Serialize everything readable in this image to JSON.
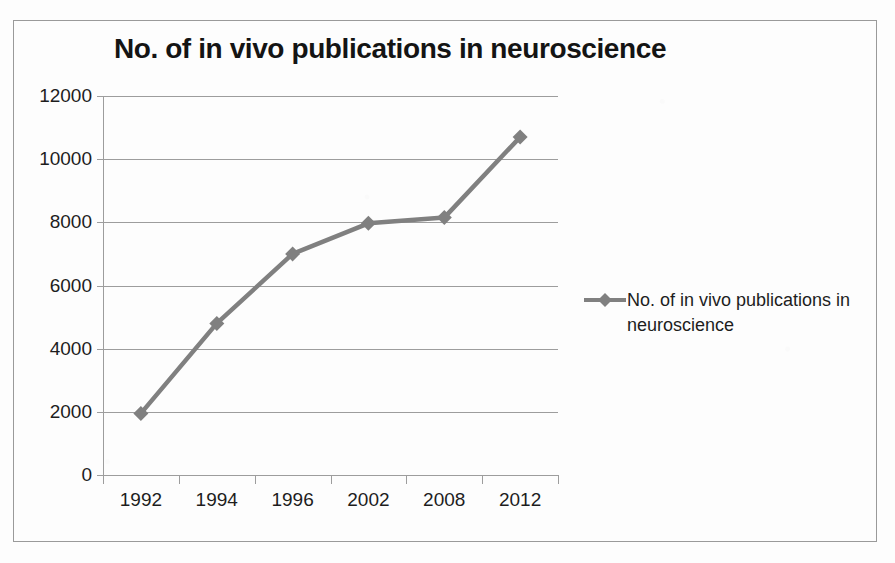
{
  "chart_data": {
    "type": "line",
    "title": "No. of in vivo publications in neuroscience",
    "xlabel": "",
    "ylabel": "",
    "categories": [
      "1992",
      "1994",
      "1996",
      "2002",
      "2008",
      "2012"
    ],
    "series": [
      {
        "name": "No. of in vivo publications in neuroscience",
        "values": [
          1950,
          4800,
          7000,
          7970,
          8150,
          10700
        ],
        "color": "#808080",
        "marker": "diamond"
      }
    ],
    "ylim": [
      0,
      12000
    ],
    "yticks": [
      "0",
      "2000",
      "4000",
      "6000",
      "8000",
      "10000",
      "12000"
    ],
    "ytick_values": [
      0,
      2000,
      4000,
      6000,
      8000,
      10000,
      12000
    ],
    "grid": true,
    "legend_position": "right"
  },
  "legend": {
    "entries": [
      {
        "label": "No. of in vivo publications in neuroscience"
      }
    ]
  },
  "colors": {
    "series": "#808080",
    "gridline": "#9d9d9d",
    "axis": "#9d9d9d",
    "title": "#141414",
    "tick_label": "#1d1d1d",
    "frame": "#9a9a9a",
    "background": "#fdfdfd"
  }
}
